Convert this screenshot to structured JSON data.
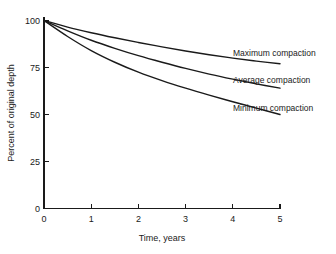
{
  "chart_data": {
    "type": "line",
    "title": "",
    "subtitle": "",
    "xlabel": "Time, years",
    "ylabel": "Percent of original depth",
    "xlim": [
      0,
      5
    ],
    "ylim": [
      0,
      100
    ],
    "xticks": [
      "0",
      "1",
      "2",
      "3",
      "4",
      "5"
    ],
    "yticks": [
      "0",
      "25",
      "50",
      "75",
      "100"
    ],
    "xtick_values": [
      0,
      1,
      2,
      3,
      4,
      5
    ],
    "ytick_values": [
      0,
      25,
      50,
      75,
      100
    ],
    "grid": false,
    "legend_position": "inline-right-labels",
    "x": [
      0,
      0.5,
      1,
      1.5,
      2,
      2.5,
      3,
      3.5,
      4,
      4.5,
      5
    ],
    "series": [
      {
        "name": "Maximum compaction",
        "label": "Maximum compaction",
        "color": "#1a1a1a",
        "values": [
          100,
          96.5,
          93.5,
          90.8,
          88.3,
          86.0,
          83.8,
          81.8,
          80.0,
          78.4,
          77.0
        ]
      },
      {
        "name": "Average compaction",
        "label": "Average compaction",
        "color": "#1a1a1a",
        "values": [
          100,
          94.5,
          89.5,
          85.2,
          81.3,
          77.8,
          74.5,
          71.5,
          68.8,
          66.3,
          64.0
        ]
      },
      {
        "name": "Minimum compaction",
        "label": "Minimum compaction",
        "color": "#1a1a1a",
        "values": [
          100,
          91.5,
          84.0,
          77.8,
          72.5,
          68.0,
          64.0,
          60.3,
          56.8,
          53.4,
          50.0
        ]
      }
    ],
    "annotations": [
      {
        "text": "Maximum compaction",
        "series": "Maximum compaction"
      },
      {
        "text": "Average compaction",
        "series": "Average compaction"
      },
      {
        "text": "Minimum compaction",
        "series": "Minimum compaction"
      }
    ],
    "colors": {
      "axis": "#1a1a1a",
      "curve": "#1a1a1a",
      "background": "#ffffff",
      "text": "#1a1a1a"
    }
  }
}
